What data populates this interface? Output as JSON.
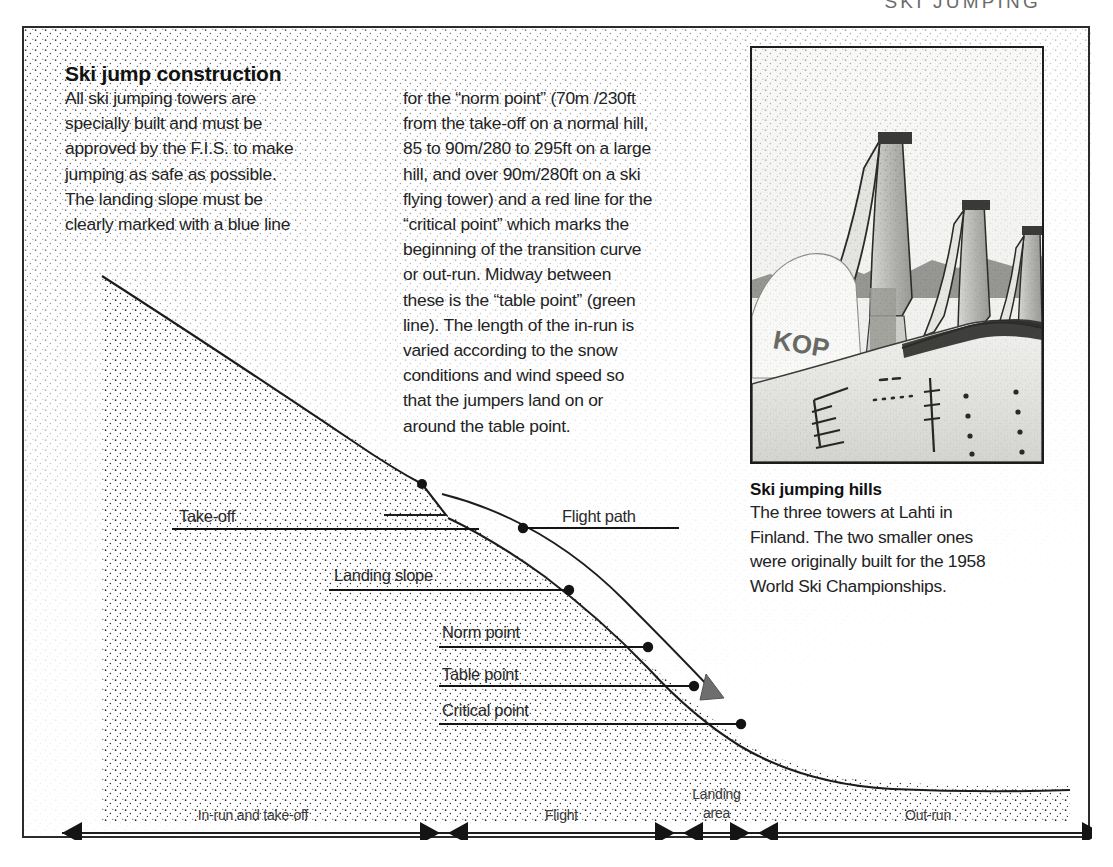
{
  "running_header": "SKI JUMPING",
  "article": {
    "headline": "Ski jump construction",
    "column_left": "All ski jumping towers are\nspecially built and must be\napproved by the F.I.S. to make\njumping as safe as possible.\nThe landing slope must be\nclearly marked with a blue line",
    "column_right": "for the “norm point” (70m /230ft\nfrom the take-off on a normal hill,\n85 to 90m/280 to 295ft on a large\nhill, and over 90m/280ft on a ski\nflying tower) and a red line for the\n“critical point” which marks the\nbeginning of the transition curve\nor out-run. Midway between\nthese is the “table point” (green\nline). The length of the in-run is\nvaried according to the snow\nconditions and wind speed so\nthat the jumpers land on or\naround the table point."
  },
  "photo": {
    "alt_name": "ski-jumping-towers-lahti",
    "sign_text": "KOP",
    "caption_title": "Ski jumping hills",
    "caption_body": "The three towers at Lahti in\nFinland. The two smaller ones\nwere originally built for the 1958\nWorld Ski Championships."
  },
  "diagram": {
    "labels": [
      {
        "id": "take-off",
        "text": "Take-off",
        "x": 155,
        "y": 479,
        "line_x1": 148,
        "line_x2": 455,
        "line_y": 501,
        "dot_x": null,
        "dot_y": null
      },
      {
        "id": "flight-path",
        "text": "Flight path",
        "x": 538,
        "y": 479,
        "line_x1": 495,
        "line_x2": 655,
        "line_y": 500,
        "dot_x": 499,
        "dot_y": 500
      },
      {
        "id": "landing-slope",
        "text": "Landing slope",
        "x": 310,
        "y": 538,
        "line_x1": 305,
        "line_x2": 548,
        "line_y": 562,
        "dot_x": 545,
        "dot_y": 562
      },
      {
        "id": "norm-point",
        "text": "Norm point",
        "x": 418,
        "y": 595,
        "line_x1": 415,
        "line_x2": 627,
        "line_y": 619,
        "dot_x": 624,
        "dot_y": 619
      },
      {
        "id": "table-point",
        "text": "Table point",
        "x": 418,
        "y": 637,
        "line_x1": 415,
        "line_x2": 673,
        "line_y": 658,
        "dot_x": 670,
        "dot_y": 658
      },
      {
        "id": "critical-point",
        "text": "Critical point",
        "x": 418,
        "y": 673,
        "line_x1": 415,
        "line_x2": 720,
        "line_y": 696,
        "dot_x": 717,
        "dot_y": 696
      }
    ],
    "axis": {
      "y": 805,
      "x_start": 38,
      "x_end": 1078,
      "dividers": [
        420,
        655,
        730
      ],
      "segments": [
        {
          "id": "in-run-and-take-off",
          "label": "In-run and take-off",
          "from": 38,
          "to": 420,
          "label_lines": [
            "In-run and take-off"
          ]
        },
        {
          "id": "flight",
          "label": "Flight",
          "from": 420,
          "to": 655,
          "label_lines": [
            "Flight"
          ]
        },
        {
          "id": "landing-area",
          "label": "Landing area",
          "from": 655,
          "to": 730,
          "label_lines": [
            "Landing",
            "area"
          ]
        },
        {
          "id": "out-run",
          "label": "Out-run",
          "from": 730,
          "to": 1078,
          "label_lines": [
            "Out-run"
          ]
        }
      ]
    }
  },
  "colors": {
    "ink": "#1a1a1a",
    "frame": "#2b2b2b",
    "body_text": "#232323",
    "header_grey": "#6b6b6b",
    "arrowhead_grey": "#6e6e6e"
  }
}
